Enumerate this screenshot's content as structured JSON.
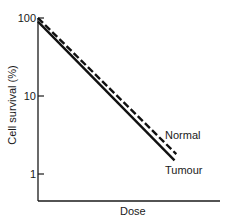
{
  "chart_data": {
    "type": "line",
    "title": "",
    "xlabel": "Dose",
    "ylabel": "Cell survival (%)",
    "yscale": "log",
    "ylim": [
      0.55,
      100
    ],
    "xlim": [
      0,
      1
    ],
    "x_ticks_shown": false,
    "y_ticks": [
      {
        "value": 100,
        "label": "100"
      },
      {
        "value": 10,
        "label": "10"
      },
      {
        "value": 1,
        "label": "1"
      }
    ],
    "grid": false,
    "legend": "none (direct labels at line ends, right)",
    "series": [
      {
        "name": "Normal",
        "style": "dashed",
        "color": "#111111",
        "x": [
          0,
          0.76
        ],
        "y": [
          100,
          1.8
        ]
      },
      {
        "name": "Tumour",
        "style": "solid",
        "color": "#111111",
        "x": [
          0,
          0.75
        ],
        "y": [
          90,
          1.5
        ]
      }
    ]
  }
}
